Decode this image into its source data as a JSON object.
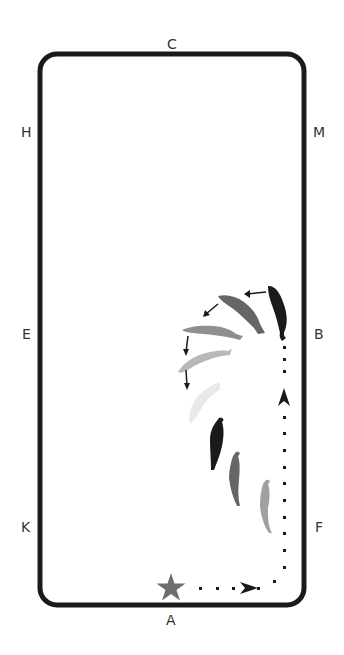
{
  "diagram": {
    "type": "dressage-arena-movement",
    "arena_letters": {
      "top": "C",
      "bottom": "A",
      "left": [
        "H",
        "E",
        "K"
      ],
      "right": [
        "M",
        "B",
        "F"
      ]
    },
    "colors": {
      "border": "#1a1a1a",
      "star": "#6e6e6e",
      "path": "#1a1a1a",
      "horse_shades": [
        "#1a1a1a",
        "#666666",
        "#8f8f8f",
        "#b8b8b8",
        "#d6d6d6",
        "#e9e9e9"
      ]
    },
    "start_marker": "star-icon",
    "annotations": [
      "dotted path from A toward B with direction arrows",
      "turn-on-haunches / pirouette arc near B",
      "horses proceeding diagonally from F region"
    ]
  }
}
